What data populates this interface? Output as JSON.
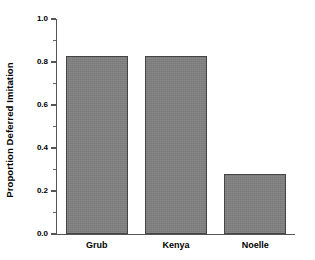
{
  "chart_data": {
    "type": "bar",
    "title": "",
    "subtitle": "",
    "xlabel": "",
    "ylabel": "Proportion Deferred Imitation",
    "categories": [
      "Grub",
      "Kenya",
      "Noelle"
    ],
    "values": [
      0.83,
      0.83,
      0.28
    ],
    "series": [
      {
        "name": "Proportion Deferred Imitation",
        "values": [
          0.83,
          0.83,
          0.28
        ]
      }
    ],
    "ylim": [
      0.0,
      1.0
    ],
    "y_major_ticks": [
      0.0,
      0.2,
      0.4,
      0.6,
      0.8,
      1.0
    ],
    "y_tick_labels": [
      "0.0",
      "0.2",
      "0.4",
      "0.6",
      "0.8",
      "1.0"
    ],
    "y_minor_ticks": [
      0.1,
      0.3,
      0.5,
      0.7,
      0.9
    ],
    "grid": false,
    "legend": "none",
    "bar_fill_color": "#808080",
    "bar_edge_color": "#454545",
    "axis_color": "#555555",
    "text_color": "#000000",
    "background_color": "#ffffff",
    "spines": [
      "left",
      "bottom"
    ]
  },
  "axis": {
    "y_title": "Proportion Deferred Imitation"
  },
  "ticks": {
    "y": [
      {
        "label": "1.0",
        "value": 1.0
      },
      {
        "label": "0.8",
        "value": 0.8
      },
      {
        "label": "0.6",
        "value": 0.6
      },
      {
        "label": "0.4",
        "value": 0.4
      },
      {
        "label": "0.2",
        "value": 0.2
      },
      {
        "label": "0.0",
        "value": 0.0
      }
    ]
  },
  "bars": [
    {
      "label": "Grub",
      "value": 0.83
    },
    {
      "label": "Kenya",
      "value": 0.83
    },
    {
      "label": "Noelle",
      "value": 0.28
    }
  ]
}
